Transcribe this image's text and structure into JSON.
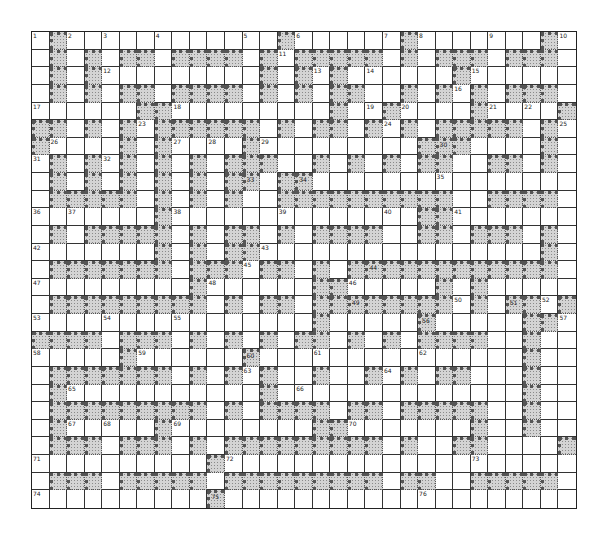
{
  "puzzle": {
    "type": "crossword",
    "rows": 27,
    "cols": 31,
    "legend": {
      "W": "white cell",
      "S": "shaded cell"
    },
    "colors": {
      "white": "#ffffff",
      "shaded": "#d4d4d4",
      "line": "#333333"
    },
    "grid": [
      "WSWWWWWWWWWWWWSWWWWWWSWWWWWWWSW",
      "WSWSWSSWSSSSWSWSSSSSWSWSSSWSSSW",
      "WSWSWWWWWWWWWSWSWSWWWWWWSWWWWWW",
      "WSWSWSSWSSSSWSWSWSSWWSWSWSWSSSW",
      "WWWWWWSSWWWWWWWWWSWWSWWWWSWWWWS",
      "SSWSWSWSSSSSSWSWSSWSWSWSSSSSWSW",
      "SWWWWSWSWWWWSWWWWWWWWWSSSWWWWSW",
      "WSWSWSWSWSWSSSWWSWSWSWSSWWSSWSW",
      "WSWSWSWSWSWSSWSSWWWWWWWWWWWWWWW",
      "WSSSSSWSWSWSWWSSSSSSSSSSWWSSSSW",
      "WWWWWWWSWWWWWWWWWWWWWWSSWWWWWWW",
      "WSWSSSSSWSWSSWSWSSSSWWSSWSSSWSW",
      "WWWWWWWSWSWSSWWWWWWWWWWWWWWWWSW",
      "WSSSSSSSWSSSWSSWSWSSSSSSSSSSSSW",
      "WWWWWWWWWSWWWWWWSSWWWWWSWSWWWWW",
      "WSSSSSSSSSWSWSSWSSSSSSSSWSWSSWS",
      "WWWWWWWWWWWWWWWWSWWWWWSWWWWWSSW",
      "SSSSWSSSWSWSWSWSSWSWSWSSSSWWSWW",
      "WWWWWSWWWWWWSWWWWWWWWWWWWWWWSWW",
      "WSSSSSSSWSWSWSWWSWWSWSWSSWWWSWW",
      "WSWWWWWWWWWWWSWWWWWWWWWWWWWWSWW",
      "WSSSSSSSSSWSWSSSSWSSWSSSSSWWSWW",
      "WSWWWWWSWWWWWWWWSSWWWWWWWSWWSWW",
      "WSSSWSSSWSWSSSSSSSSSWSWWSSWWWWS",
      "WWWWWWWWWWSWWWWWWWWWWWWWWWWWWWW",
      "WSSSWSSSSSWSSSSSSSSSWSSWWSSSSSW",
      "WWWWWWWWWWSWWWWWWWWWWWWWWWWWWWW"
    ],
    "numbers": [
      {
        "n": "1",
        "r": 0,
        "c": 0
      },
      {
        "n": "2",
        "r": 0,
        "c": 2
      },
      {
        "n": "3",
        "r": 0,
        "c": 4
      },
      {
        "n": "4",
        "r": 0,
        "c": 7
      },
      {
        "n": "5",
        "r": 0,
        "c": 12
      },
      {
        "n": "6",
        "r": 0,
        "c": 15
      },
      {
        "n": "7",
        "r": 0,
        "c": 20
      },
      {
        "n": "8",
        "r": 0,
        "c": 22
      },
      {
        "n": "9",
        "r": 0,
        "c": 26
      },
      {
        "n": "10",
        "r": 0,
        "c": 30
      },
      {
        "n": "11",
        "r": 1,
        "c": 14
      },
      {
        "n": "12",
        "r": 2,
        "c": 4
      },
      {
        "n": "13",
        "r": 2,
        "c": 16
      },
      {
        "n": "14",
        "r": 2,
        "c": 19
      },
      {
        "n": "15",
        "r": 2,
        "c": 25
      },
      {
        "n": "16",
        "r": 3,
        "c": 24
      },
      {
        "n": "17",
        "r": 4,
        "c": 0
      },
      {
        "n": "18",
        "r": 4,
        "c": 8
      },
      {
        "n": "19",
        "r": 4,
        "c": 19
      },
      {
        "n": "20",
        "r": 4,
        "c": 21
      },
      {
        "n": "21",
        "r": 4,
        "c": 26
      },
      {
        "n": "22",
        "r": 4,
        "c": 28
      },
      {
        "n": "23",
        "r": 5,
        "c": 6
      },
      {
        "n": "24",
        "r": 5,
        "c": 20
      },
      {
        "n": "25",
        "r": 5,
        "c": 30
      },
      {
        "n": "26",
        "r": 6,
        "c": 1
      },
      {
        "n": "27",
        "r": 6,
        "c": 8
      },
      {
        "n": "28",
        "r": 6,
        "c": 10
      },
      {
        "n": "29",
        "r": 6,
        "c": 13
      },
      {
        "n": "30",
        "r": 6,
        "c": 23
      },
      {
        "n": "31",
        "r": 7,
        "c": 0
      },
      {
        "n": "32",
        "r": 7,
        "c": 4
      },
      {
        "n": "33",
        "r": 8,
        "c": 12
      },
      {
        "n": "34",
        "r": 8,
        "c": 15
      },
      {
        "n": "35",
        "r": 8,
        "c": 23
      },
      {
        "n": "36",
        "r": 10,
        "c": 0
      },
      {
        "n": "37",
        "r": 10,
        "c": 2
      },
      {
        "n": "38",
        "r": 10,
        "c": 8
      },
      {
        "n": "39",
        "r": 10,
        "c": 14
      },
      {
        "n": "40",
        "r": 10,
        "c": 20
      },
      {
        "n": "41",
        "r": 10,
        "c": 24
      },
      {
        "n": "42",
        "r": 12,
        "c": 0
      },
      {
        "n": "43",
        "r": 12,
        "c": 13
      },
      {
        "n": "44",
        "r": 13,
        "c": 19
      },
      {
        "n": "45",
        "r": 13,
        "c": 12
      },
      {
        "n": "46",
        "r": 14,
        "c": 18
      },
      {
        "n": "47",
        "r": 14,
        "c": 0
      },
      {
        "n": "48",
        "r": 14,
        "c": 10
      },
      {
        "n": "49",
        "r": 15,
        "c": 18
      },
      {
        "n": "50",
        "r": 15,
        "c": 24
      },
      {
        "n": "51",
        "r": 15,
        "c": 27
      },
      {
        "n": "52",
        "r": 15,
        "c": 29
      },
      {
        "n": "53",
        "r": 16,
        "c": 0
      },
      {
        "n": "54",
        "r": 16,
        "c": 4
      },
      {
        "n": "55",
        "r": 16,
        "c": 8
      },
      {
        "n": "56",
        "r": 16,
        "c": 22
      },
      {
        "n": "57",
        "r": 16,
        "c": 30
      },
      {
        "n": "58",
        "r": 18,
        "c": 0
      },
      {
        "n": "59",
        "r": 18,
        "c": 6
      },
      {
        "n": "60",
        "r": 18,
        "c": 12
      },
      {
        "n": "61",
        "r": 18,
        "c": 16
      },
      {
        "n": "62",
        "r": 18,
        "c": 22
      },
      {
        "n": "63",
        "r": 19,
        "c": 12
      },
      {
        "n": "64",
        "r": 19,
        "c": 20
      },
      {
        "n": "65",
        "r": 20,
        "c": 2
      },
      {
        "n": "66",
        "r": 20,
        "c": 15
      },
      {
        "n": "67",
        "r": 22,
        "c": 2
      },
      {
        "n": "68",
        "r": 22,
        "c": 4
      },
      {
        "n": "69",
        "r": 22,
        "c": 8
      },
      {
        "n": "70",
        "r": 22,
        "c": 18
      },
      {
        "n": "71",
        "r": 24,
        "c": 0
      },
      {
        "n": "72",
        "r": 24,
        "c": 11
      },
      {
        "n": "73",
        "r": 24,
        "c": 25
      },
      {
        "n": "74",
        "r": 26,
        "c": 0
      },
      {
        "n": "75",
        "r": 26,
        "c": 10
      },
      {
        "n": "76",
        "r": 26,
        "c": 22
      }
    ]
  }
}
